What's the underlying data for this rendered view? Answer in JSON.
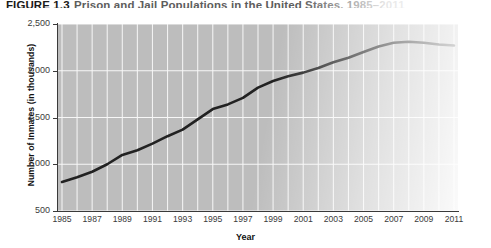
{
  "figure": {
    "label": "FIGURE 1.3",
    "title_rest": "Prison and Jail Populations in the United States, 1985–2011"
  },
  "chart_data": {
    "type": "line",
    "title": "Prison and Jail Populations in the United States, 1985–2011",
    "xlabel": "Year",
    "ylabel": "Number of Inmates (in thousands)",
    "ylim": [
      500,
      2500
    ],
    "xlim": [
      1985,
      2011
    ],
    "yticks": [
      500,
      1000,
      1500,
      2000,
      2500
    ],
    "ytick_labels": [
      "500",
      "1,000",
      "1,500",
      "2,000",
      "2,500"
    ],
    "xticks": [
      1985,
      1987,
      1989,
      1991,
      1993,
      1995,
      1997,
      1999,
      2001,
      2003,
      2005,
      2007,
      2009,
      2011
    ],
    "xtick_labels": [
      "1985",
      "1987",
      "1989",
      "1991",
      "1993",
      "1995",
      "1997",
      "1999",
      "2001",
      "2003",
      "2005",
      "2007",
      "2009",
      "2011"
    ],
    "grid": "white gridlines, vertical every year, horizontal at each y tick",
    "legend": "none",
    "line_color": "#222222",
    "plot_background": "#bdbdbd",
    "x": [
      1985,
      1986,
      1987,
      1988,
      1989,
      1990,
      1991,
      1992,
      1993,
      1994,
      1995,
      1996,
      1997,
      1998,
      1999,
      2000,
      2001,
      2002,
      2003,
      2004,
      2005,
      2006,
      2007,
      2008,
      2009,
      2010,
      2011
    ],
    "values": [
      810,
      860,
      920,
      1000,
      1100,
      1150,
      1220,
      1300,
      1370,
      1480,
      1590,
      1640,
      1710,
      1820,
      1890,
      1940,
      1980,
      2030,
      2090,
      2140,
      2200,
      2260,
      2300,
      2310,
      2300,
      2280,
      2270
    ],
    "series": [
      {
        "name": "Total prison and jail inmates (thousands)",
        "values": [
          810,
          860,
          920,
          1000,
          1100,
          1150,
          1220,
          1300,
          1370,
          1480,
          1590,
          1640,
          1710,
          1820,
          1890,
          1940,
          1980,
          2030,
          2090,
          2140,
          2200,
          2260,
          2300,
          2310,
          2300,
          2280,
          2270
        ]
      }
    ]
  }
}
